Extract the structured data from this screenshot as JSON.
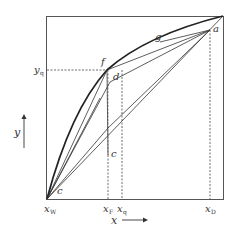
{
  "diagram": {
    "type": "McCabe-Thiele x-y diagram",
    "axes": {
      "x_label": "x",
      "y_label": "y",
      "x_ticks": [
        {
          "main": "x",
          "sub": "W"
        },
        {
          "main": "x",
          "sub": "F"
        },
        {
          "main": "x",
          "sub": "q"
        },
        {
          "main": "x",
          "sub": "D"
        }
      ],
      "y_ticks": [
        {
          "main": "y",
          "sub": "q"
        }
      ]
    },
    "points": {
      "a": "a",
      "c_top": "c",
      "c_bottom": "c",
      "d": "d",
      "f": "f",
      "g": "g"
    },
    "colors": {
      "line": "#333333",
      "box": "#555555",
      "background": "#ffffff"
    }
  }
}
